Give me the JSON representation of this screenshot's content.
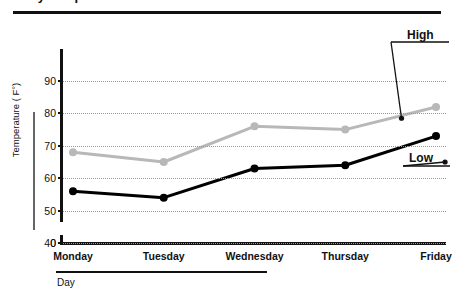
{
  "title": {
    "text": "Daily Temperatures",
    "clipped": true
  },
  "chart_data": {
    "type": "line",
    "title": "Daily Temperatures",
    "xlabel": "Day",
    "ylabel": "Temperature ( F°)",
    "categories": [
      "Monday",
      "Tuesday",
      "Wednesday",
      "Thursday",
      "Friday"
    ],
    "series": [
      {
        "name": "High",
        "color": "#b8b8b8",
        "values": [
          68,
          65,
          76,
          75,
          82
        ]
      },
      {
        "name": "Low",
        "color": "#000000",
        "values": [
          56,
          54,
          63,
          64,
          73
        ]
      }
    ],
    "ylim": [
      40,
      90
    ],
    "yticks": [
      0,
      40,
      50,
      60,
      70,
      80,
      90
    ],
    "ytick_labels": [
      "0",
      "40",
      "50",
      "60",
      "70",
      "80",
      "90"
    ],
    "axis_break": true,
    "grid": true,
    "grid_style": "dotted",
    "legend": "annotations",
    "annotations": [
      {
        "label": "High",
        "target_series": "High",
        "target_x": 3.62,
        "target_y": 78.5
      },
      {
        "label": "Low",
        "target_series": "Low",
        "target_x": 4.1,
        "target_y": 65.0
      }
    ]
  }
}
